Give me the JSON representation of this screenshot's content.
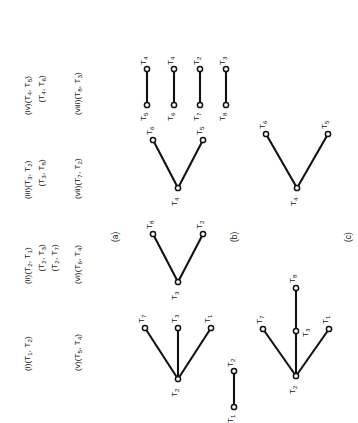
{
  "figure": {
    "orientation": "rotated-90-ccw",
    "ink_color": "#111111",
    "background_color": "#ffffff",
    "captions": {
      "a": "(a)",
      "b": "(b)",
      "c": "(c)"
    }
  },
  "panel_a": {
    "title": "ordered pair list",
    "entries": [
      {
        "index": "(i)",
        "lines": [
          {
            "text": "(i)(T",
            "sub1": "1",
            "mid": ", T",
            "sub2": "2",
            "close": ")",
            "indent": false,
            "full": "(i)(T1, T2)"
          }
        ]
      },
      {
        "index": "(ii)",
        "lines": [
          {
            "full": "(ii)(T2, T1)",
            "indent": false
          },
          {
            "full": "(T2, T3)",
            "indent": true
          },
          {
            "full": "(T2, T7)",
            "indent": true
          }
        ]
      },
      {
        "index": "(iii)",
        "lines": [
          {
            "full": "(iii)(T3, T2)",
            "indent": false
          },
          {
            "full": "(T3, T8)",
            "indent": true
          }
        ]
      },
      {
        "index": "(iv)",
        "lines": [
          {
            "full": "(iv)(T4, T5)",
            "indent": false
          },
          {
            "full": "(T4, T6)",
            "indent": true
          }
        ]
      },
      {
        "index": "(v)",
        "lines": [
          {
            "full": "(v)(T5, T4)",
            "indent": false
          }
        ]
      },
      {
        "index": "(vi)",
        "lines": [
          {
            "full": "(vi)(T6, T4)",
            "indent": false
          }
        ]
      },
      {
        "index": "(vii)",
        "lines": [
          {
            "full": "(vii)(T7, T2)",
            "indent": false
          }
        ]
      },
      {
        "index": "(viii)",
        "lines": [
          {
            "full": "(viii)(T8, T3)",
            "indent": false
          }
        ]
      }
    ],
    "rendered": {
      "r1c1": "(i)(T",
      "r1c1s1": "1",
      "r1c1m": ", T",
      "r1c1s2": "2",
      "r1c1e": ")",
      "r1c2": "(ii)(T",
      "r1c2s1": "2",
      "r1c2m": ", T",
      "r1c2s2": "1",
      "r1c2e": ")",
      "r1c2b": "(T",
      "r1c2bs1": "2",
      "r1c2bm": ", T",
      "r1c2bs2": "3",
      "r1c2be": ")",
      "r1c2c": "(T",
      "r1c2cs1": "2",
      "r1c2cm": ", T",
      "r1c2cs2": "7",
      "r1c2ce": ")",
      "r1c3": "(iii)(T",
      "r1c3s1": "3",
      "r1c3m": ", T",
      "r1c3s2": "2",
      "r1c3e": ")",
      "r1c3b": "(T",
      "r1c3bs1": "3",
      "r1c3bm": ", T",
      "r1c3bs2": "8",
      "r1c3be": ")",
      "r1c4": "(iv)(T",
      "r1c4s1": "4",
      "r1c4m": ", T",
      "r1c4s2": "5",
      "r1c4e": ")",
      "r1c4b": "(T",
      "r1c4bs1": "4",
      "r1c4bm": ", T",
      "r1c4bs2": "6",
      "r1c4be": ")",
      "r2c1": "(v)(T",
      "r2c1s1": "5",
      "r2c1m": ", T",
      "r2c1s2": "4",
      "r2c1e": ")",
      "r2c2": "(vi)(T",
      "r2c2s1": "6",
      "r2c2m": ", T",
      "r2c2s2": "4",
      "r2c2e": ")",
      "r2c3": "(vii)(T",
      "r2c3s1": "7",
      "r2c3m": ", T",
      "r2c3s2": "2",
      "r2c3e": ")",
      "r2c4": "(viii)(T",
      "r2c4s1": "8",
      "r2c4m": ", T",
      "r2c4s2": "3",
      "r2c4e": ")"
    }
  },
  "panel_b": {
    "title": "individual adjacency stars",
    "graphs": [
      {
        "center": "T2",
        "leaves": [
          "T7",
          "T3",
          "T1"
        ],
        "kind": "star3"
      },
      {
        "center": "T3",
        "leaves": [
          "T8",
          "T2"
        ],
        "kind": "star2"
      },
      {
        "center": "T4",
        "leaves": [
          "T6",
          "T5"
        ],
        "kind": "star2"
      },
      {
        "edge": [
          "T5",
          "T4"
        ],
        "kind": "edge"
      },
      {
        "edge": [
          "T6",
          "T4"
        ],
        "kind": "edge"
      },
      {
        "edge": [
          "T7",
          "T2"
        ],
        "kind": "edge"
      },
      {
        "edge": [
          "T8",
          "T3"
        ],
        "kind": "edge"
      },
      {
        "edge": [
          "T1",
          "T2"
        ],
        "kind": "edge"
      }
    ],
    "labels": {
      "g1_center": "T",
      "g1_center_sub": "2",
      "g1_l1": "T",
      "g1_l1_sub": "7",
      "g1_l2": "T",
      "g1_l2_sub": "3",
      "g1_l3": "T",
      "g1_l3_sub": "1",
      "g2_center": "T",
      "g2_center_sub": "3",
      "g2_l1": "T",
      "g2_l1_sub": "8",
      "g2_l2": "T",
      "g2_l2_sub": "2",
      "g3_center": "T",
      "g3_center_sub": "4",
      "g3_l1": "T",
      "g3_l1_sub": "6",
      "g3_l2": "T",
      "g3_l2_sub": "5",
      "e1_a": "T",
      "e1_a_sub": "5",
      "e1_b": "T",
      "e1_b_sub": "4",
      "e2_a": "T",
      "e2_a_sub": "6",
      "e2_b": "T",
      "e2_b_sub": "4",
      "e3_a": "T",
      "e3_a_sub": "7",
      "e3_b": "T",
      "e3_b_sub": "2",
      "e4_a": "T",
      "e4_a_sub": "8",
      "e4_b": "T",
      "e4_b_sub": "3",
      "e0_a": "T",
      "e0_a_sub": "1",
      "e0_b": "T",
      "e0_b_sub": "2"
    }
  },
  "panel_c": {
    "title": "merged components",
    "graphs": [
      {
        "center": "T2",
        "branches": [
          "T7",
          "T1"
        ],
        "path": [
          "T2",
          "T3",
          "T8"
        ],
        "kind": "tree"
      },
      {
        "center": "T4",
        "leaves": [
          "T6",
          "T5"
        ],
        "kind": "star2"
      }
    ],
    "labels": {
      "c1_center": "T",
      "c1_center_sub": "2",
      "c1_top": "T",
      "c1_top_sub": "7",
      "c1_mid": "T",
      "c1_mid_sub": "3",
      "c1_end": "T",
      "c1_end_sub": "8",
      "c1_bot": "T",
      "c1_bot_sub": "1",
      "c2_center": "T",
      "c2_center_sub": "4",
      "c2_top": "T",
      "c2_top_sub": "6",
      "c2_bot": "T",
      "c2_bot_sub": "5"
    }
  }
}
